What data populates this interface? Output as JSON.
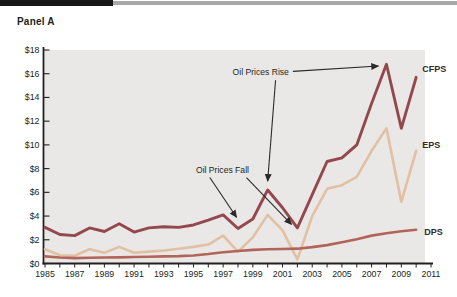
{
  "header": {
    "panel_label": "Panel A"
  },
  "chart_data": {
    "type": "line",
    "title": "",
    "xlabel": "",
    "ylabel": "",
    "x_range": [
      1985,
      2011
    ],
    "ylim": [
      0,
      18
    ],
    "grid": false,
    "legend_position": "right-edge-inline-labels",
    "plot_bg": "#e9e8e6",
    "axis_color": "#231f20",
    "annotation_color": "#2a2a2a",
    "y_tick_labels": [
      "$0",
      "$2",
      "$4",
      "$6",
      "$8",
      "$10",
      "$12",
      "$14",
      "$16",
      "$18"
    ],
    "x_tick_labels": [
      "1985",
      "1987",
      "1989",
      "1991",
      "1993",
      "1995",
      "1997",
      "1999",
      "2001",
      "2003",
      "2005",
      "2007",
      "2009",
      "2011"
    ],
    "x": [
      1985,
      1986,
      1987,
      1988,
      1989,
      1990,
      1991,
      1992,
      1993,
      1994,
      1995,
      1996,
      1997,
      1998,
      1999,
      2000,
      2001,
      2002,
      2003,
      2004,
      2005,
      2006,
      2007,
      2008,
      2009,
      2010
    ],
    "series": [
      {
        "name": "CFPS",
        "color": "#93484e",
        "width": 2.9,
        "label_dx": 6,
        "label_dy": -5,
        "values": [
          3.05,
          2.45,
          2.35,
          3.0,
          2.7,
          3.35,
          2.65,
          3.0,
          3.1,
          3.05,
          3.25,
          3.65,
          4.1,
          2.95,
          3.75,
          6.2,
          4.7,
          3.0,
          5.8,
          8.6,
          8.9,
          10.0,
          13.5,
          16.8,
          11.4,
          15.7
        ]
      },
      {
        "name": "EPS",
        "color": "#e1c0a3",
        "width": 2.6,
        "label_dx": 6,
        "label_dy": -3,
        "values": [
          1.2,
          0.7,
          0.65,
          1.2,
          0.9,
          1.4,
          0.9,
          1.0,
          1.1,
          1.25,
          1.4,
          1.6,
          2.35,
          1.0,
          2.2,
          4.1,
          2.8,
          0.35,
          4.0,
          6.3,
          6.6,
          7.3,
          9.5,
          11.4,
          5.2,
          9.5
        ]
      },
      {
        "name": "DPS",
        "color": "#b26459",
        "width": 2.6,
        "label_dx": 8,
        "label_dy": 5,
        "values": [
          0.6,
          0.5,
          0.45,
          0.48,
          0.5,
          0.52,
          0.55,
          0.57,
          0.6,
          0.62,
          0.68,
          0.8,
          0.95,
          1.05,
          1.15,
          1.2,
          1.22,
          1.25,
          1.38,
          1.55,
          1.8,
          2.05,
          2.35,
          2.55,
          2.72,
          2.85
        ]
      }
    ],
    "annotations": [
      {
        "text": "Oil Prices Rise",
        "anchor": "end",
        "pos": {
          "year": 2001.43,
          "value": 15.9
        },
        "arrows": [
          {
            "year1": 2001.7,
            "value1": 16.2,
            "year2": 2007.45,
            "value2": 16.65
          },
          {
            "year1": 2000.53,
            "value1": 15.45,
            "year2": 2000.0,
            "value2": 6.95
          }
        ]
      },
      {
        "text": "Oil Prices Fall",
        "anchor": "end",
        "pos": {
          "year": 1998.74,
          "value": 7.6
        },
        "arrows": [
          {
            "year1": 1996.1,
            "value1": 7.25,
            "year2": 1997.9,
            "value2": 3.9
          },
          {
            "year1": 1998.57,
            "value1": 7.25,
            "year2": 2001.6,
            "value2": 3.3
          }
        ]
      }
    ]
  }
}
